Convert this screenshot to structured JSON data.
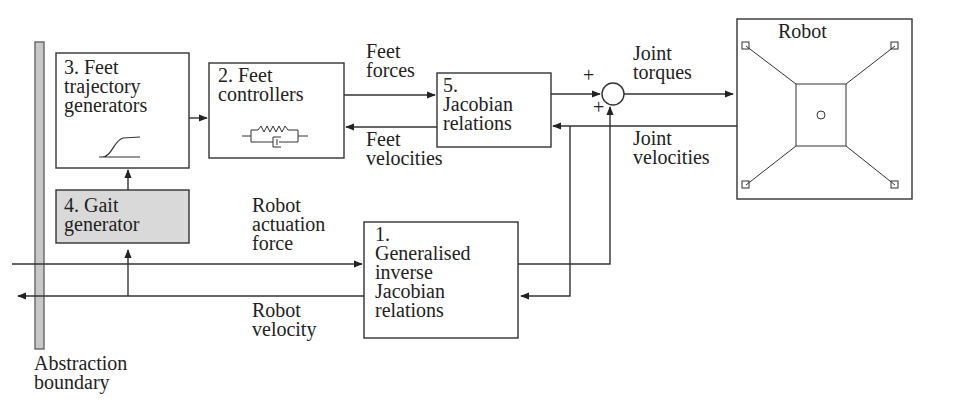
{
  "blocks": {
    "feet_trajectory": {
      "label": "3. Feet\ntrajectory\ngenerators",
      "icon": "s-curve-icon"
    },
    "feet_controllers": {
      "label": "2. Feet\ncontrollers",
      "icon": "spring-damper-icon"
    },
    "jacobian": {
      "label": "5.\nJacobian\nrelations"
    },
    "gait": {
      "label": "4. Gait\ngenerator",
      "fill": "#d9d9d9"
    },
    "generalised": {
      "label": "1.\nGeneralised\ninverse\nJacobian\nrelations"
    },
    "robot": {
      "label": "Robot",
      "icon": "robot-schematic-icon"
    }
  },
  "signals": {
    "feet_forces": "Feet\nforces",
    "feet_velocities": "Feet\nvelocities",
    "joint_torques": "Joint\ntorques",
    "joint_velocities": "Joint\nvelocities",
    "robot_actuation_force": "Robot\nactuation\nforce",
    "robot_velocity": "Robot\nvelocity"
  },
  "summing_junction": {
    "plus_top": "+",
    "plus_bottom": "+"
  },
  "boundary": {
    "label": "Abstraction\nboundary",
    "fill": "#c8c8c8"
  }
}
